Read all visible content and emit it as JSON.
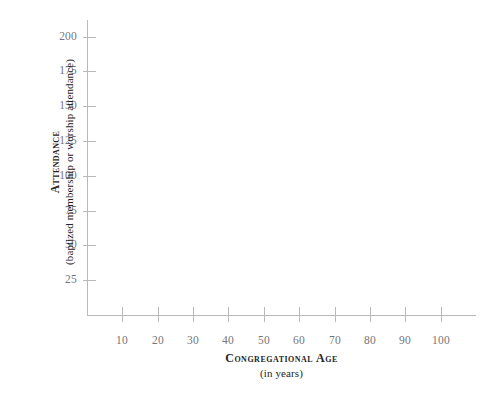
{
  "chart_data": {
    "type": "scatter",
    "title": "",
    "subtitle": "",
    "xlabel": "Congregational Age",
    "xlabel_sub": "(in years)",
    "ylabel": "Attendance",
    "ylabel_sub": "(baptized membership or worship attendance)",
    "xlim": [
      0,
      110
    ],
    "ylim": [
      0,
      212
    ],
    "xticks": [
      10,
      20,
      30,
      40,
      50,
      60,
      70,
      80,
      90,
      100
    ],
    "xticklabels": [
      "10",
      "20",
      "30",
      "40",
      "50",
      "60",
      "70",
      "80",
      "90",
      "100"
    ],
    "yticks": [
      25,
      50,
      75,
      100,
      125,
      150,
      175,
      200
    ],
    "yticklabels": [
      "25",
      "50",
      "75",
      "100",
      "125",
      "150",
      "175",
      "200"
    ],
    "grid": false,
    "legend": null,
    "series": [],
    "values": [],
    "annotations": [],
    "note": "empty plot template - axes drawn with no data points plotted"
  },
  "colors": {
    "background": "#ffffff",
    "axis": "#b9b9b9",
    "tick_label": "#76757a",
    "axis_title": "#262626"
  }
}
